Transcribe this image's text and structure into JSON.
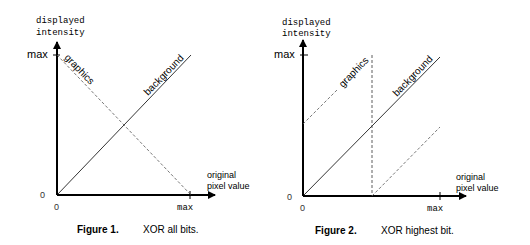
{
  "figures": [
    {
      "id": "figure-1",
      "y_axis_label_line1": "displayed",
      "y_axis_label_line2": "intensity",
      "x_axis_label_line1": "original",
      "x_axis_label_line2": "pixel value",
      "y_max_label": "max",
      "y_zero_label": "0",
      "x_zero_label": "0",
      "x_max_label": "max",
      "graphics_label": "graphics",
      "background_label": "background",
      "caption_number": "Figure 1.",
      "caption_text": "XOR all bits."
    },
    {
      "id": "figure-2",
      "y_axis_label_line1": "displayed",
      "y_axis_label_line2": "intensity",
      "x_axis_label_line1": "original",
      "x_axis_label_line2": "pixel value",
      "y_max_label": "max",
      "y_zero_label": "0",
      "x_zero_label": "0",
      "x_max_label": "max",
      "graphics_label": "graphics",
      "background_label": "background",
      "caption_number": "Figure 2.",
      "caption_text": "XOR highest bit."
    }
  ],
  "colors": {
    "line": "#000000",
    "dashed": "#555555"
  }
}
